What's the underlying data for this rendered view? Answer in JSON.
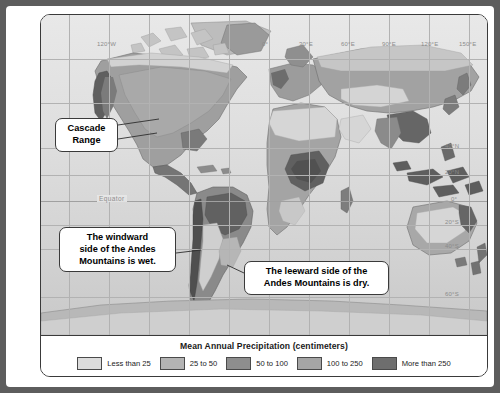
{
  "figure": {
    "legend_title": "Mean Annual Precipitation (centimeters)",
    "legend_items": [
      {
        "label": "Less than 25",
        "color": "#dcdcdc"
      },
      {
        "label": "25 to 50",
        "color": "#b4b4b4"
      },
      {
        "label": "50 to 100",
        "color": "#8e8e8e"
      },
      {
        "label": "100 to 250",
        "color": "#a5a5a5"
      },
      {
        "label": "More than 250",
        "color": "#6e6e6e"
      }
    ]
  },
  "callouts": {
    "cascade": {
      "line1": "Cascade",
      "line2": "Range"
    },
    "windward": {
      "line1": "The windward",
      "line2": "side of the Andes",
      "line3": "Mountains is wet."
    },
    "leeward": {
      "line1": "The leeward side of the",
      "line2": "Andes Mountains is dry."
    }
  },
  "map": {
    "equator_label": "Equator",
    "longitudes": [
      {
        "label": "120°W",
        "x": 68
      },
      {
        "label": "0°",
        "x": 228
      },
      {
        "label": "30°E",
        "x": 268
      },
      {
        "label": "60°E",
        "x": 311
      },
      {
        "label": "90°E",
        "x": 352
      },
      {
        "label": "120°E",
        "x": 392
      },
      {
        "label": "150°E",
        "x": 428
      }
    ],
    "latitudes": [
      {
        "label": "40°N",
        "y": 133
      },
      {
        "label": "20°N",
        "y": 158
      },
      {
        "label": "0°",
        "y": 186
      },
      {
        "label": "20°S",
        "y": 208
      },
      {
        "label": "40°S",
        "y": 231
      },
      {
        "label": "60°S",
        "y": 280
      }
    ]
  }
}
